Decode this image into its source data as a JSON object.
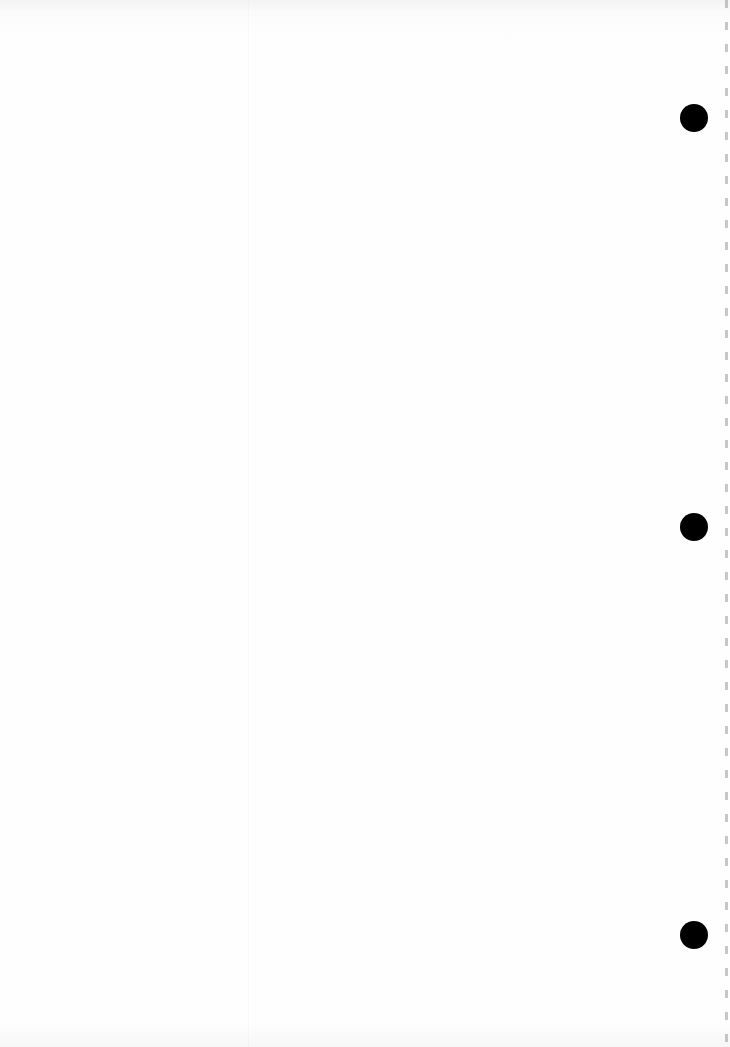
{
  "document": {
    "type": "blank scanned page",
    "bleed_through_text": "",
    "hole_punches": [
      {
        "x": 694,
        "y": 118
      },
      {
        "x": 694,
        "y": 527
      },
      {
        "x": 694,
        "y": 935
      }
    ]
  }
}
